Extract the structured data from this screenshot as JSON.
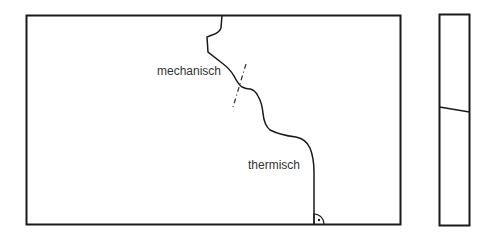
{
  "labels": {
    "mechanical": "mechanisch",
    "thermal": "thermisch"
  },
  "colors": {
    "line": "#1a1a1a",
    "text": "#333333",
    "background": "#ffffff"
  }
}
